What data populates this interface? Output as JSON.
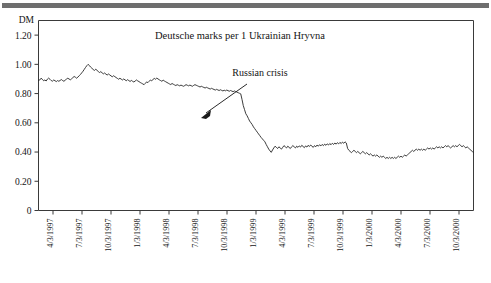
{
  "figure": {
    "background_color": "#ffffff",
    "rule_color": "#6e6e6e",
    "line_color": "#262626"
  },
  "chart_data": {
    "type": "line",
    "title": "Deutsche marks per 1 Ukrainian Hryvna",
    "xlabel": "",
    "ylabel": "DM",
    "ylim": [
      0,
      1.3
    ],
    "grid": false,
    "legend": "none",
    "ytick_labels": [
      "1.20",
      "1.00",
      "0.80",
      "0.60",
      "0.40",
      "0.20",
      "0"
    ],
    "ytick_values": [
      1.2,
      1.0,
      0.8,
      0.6,
      0.4,
      0.2,
      0
    ],
    "xtick_labels": [
      "4/3/1997",
      "7/3/1997",
      "10/3/1997",
      "1/3/1998",
      "4/3/1998",
      "7/3/1998",
      "10/3/1998",
      "1/3/1999",
      "4/3/1999",
      "7/3/1999",
      "10/3/1999",
      "1/3/2000",
      "4/3/2000",
      "7/3/2000",
      "10/3/2000"
    ],
    "annotations": [
      {
        "text": "Russian crisis",
        "points_to_x": "8/1998",
        "points_to_y": 0.62
      }
    ],
    "series": [
      {
        "name": "DM per 1 UAH",
        "values": [
          0.89,
          0.893,
          0.905,
          0.898,
          0.888,
          0.893,
          0.886,
          0.899,
          0.906,
          0.898,
          0.889,
          0.885,
          0.893,
          0.888,
          0.882,
          0.889,
          0.884,
          0.89,
          0.896,
          0.889,
          0.884,
          0.892,
          0.899,
          0.905,
          0.9,
          0.894,
          0.901,
          0.909,
          0.917,
          0.912,
          0.905,
          0.913,
          0.922,
          0.931,
          0.942,
          0.953,
          0.966,
          0.979,
          0.991,
          1.0,
          0.992,
          0.981,
          0.973,
          0.965,
          0.958,
          0.967,
          0.959,
          0.951,
          0.944,
          0.95,
          0.942,
          0.935,
          0.941,
          0.933,
          0.927,
          0.934,
          0.928,
          0.921,
          0.915,
          0.922,
          0.916,
          0.91,
          0.904,
          0.898,
          0.905,
          0.899,
          0.893,
          0.9,
          0.894,
          0.888,
          0.895,
          0.889,
          0.883,
          0.89,
          0.884,
          0.879,
          0.886,
          0.893,
          0.887,
          0.882,
          0.876,
          0.871,
          0.866,
          0.861,
          0.87,
          0.88,
          0.875,
          0.884,
          0.893,
          0.888,
          0.896,
          0.904,
          0.898,
          0.906,
          0.9,
          0.894,
          0.889,
          0.884,
          0.892,
          0.886,
          0.881,
          0.876,
          0.871,
          0.866,
          0.862,
          0.869,
          0.864,
          0.859,
          0.855,
          0.861,
          0.857,
          0.853,
          0.858,
          0.854,
          0.85,
          0.855,
          0.861,
          0.857,
          0.853,
          0.858,
          0.854,
          0.85,
          0.856,
          0.861,
          0.857,
          0.853,
          0.849,
          0.845,
          0.85,
          0.846,
          0.842,
          0.838,
          0.843,
          0.839,
          0.835,
          0.831,
          0.836,
          0.832,
          0.828,
          0.824,
          0.829,
          0.825,
          0.821,
          0.826,
          0.822,
          0.818,
          0.823,
          0.819,
          0.824,
          0.82,
          0.816,
          0.821,
          0.817,
          0.813,
          0.818,
          0.814,
          0.81,
          0.806,
          0.802,
          0.798,
          0.76,
          0.718,
          0.69,
          0.662,
          0.648,
          0.63,
          0.612,
          0.6,
          0.588,
          0.572,
          0.56,
          0.548,
          0.536,
          0.524,
          0.512,
          0.5,
          0.49,
          0.48,
          0.47,
          0.452,
          0.436,
          0.42,
          0.408,
          0.398,
          0.414,
          0.428,
          0.44,
          0.432,
          0.424,
          0.436,
          0.428,
          0.42,
          0.432,
          0.444,
          0.436,
          0.428,
          0.44,
          0.432,
          0.424,
          0.436,
          0.444,
          0.436,
          0.428,
          0.44,
          0.432,
          0.442,
          0.434,
          0.446,
          0.438,
          0.43,
          0.442,
          0.434,
          0.446,
          0.438,
          0.448,
          0.44,
          0.432,
          0.444,
          0.436,
          0.448,
          0.44,
          0.45,
          0.442,
          0.452,
          0.444,
          0.454,
          0.446,
          0.456,
          0.448,
          0.458,
          0.45,
          0.46,
          0.452,
          0.462,
          0.454,
          0.464,
          0.456,
          0.466,
          0.458,
          0.468,
          0.46,
          0.47,
          0.462,
          0.425,
          0.412,
          0.404,
          0.396,
          0.404,
          0.412,
          0.404,
          0.396,
          0.404,
          0.396,
          0.388,
          0.396,
          0.404,
          0.396,
          0.388,
          0.396,
          0.388,
          0.38,
          0.388,
          0.38,
          0.372,
          0.38,
          0.372,
          0.38,
          0.372,
          0.364,
          0.372,
          0.364,
          0.372,
          0.364,
          0.356,
          0.364,
          0.356,
          0.364,
          0.356,
          0.364,
          0.356,
          0.364,
          0.356,
          0.364,
          0.372,
          0.364,
          0.372,
          0.364,
          0.372,
          0.38,
          0.372,
          0.38,
          0.388,
          0.396,
          0.404,
          0.412,
          0.404,
          0.412,
          0.42,
          0.412,
          0.42,
          0.412,
          0.42,
          0.412,
          0.42,
          0.412,
          0.42,
          0.428,
          0.42,
          0.428,
          0.42,
          0.428,
          0.42,
          0.428,
          0.436,
          0.428,
          0.436,
          0.428,
          0.436,
          0.428,
          0.436,
          0.444,
          0.436,
          0.444,
          0.436,
          0.428,
          0.436,
          0.444,
          0.436,
          0.444,
          0.436,
          0.444,
          0.452,
          0.444,
          0.436,
          0.444,
          0.436,
          0.428,
          0.436,
          0.428,
          0.42,
          0.412,
          0.404,
          0.396
        ]
      }
    ]
  }
}
